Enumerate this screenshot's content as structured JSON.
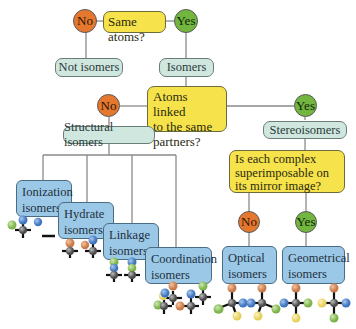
{
  "diagram": {
    "q1": {
      "text": "Same atoms?",
      "no": "No",
      "yes": "Yes"
    },
    "not_isomers": "Not isomers",
    "isomers": "Isomers",
    "q2": {
      "line1": "Atoms linked",
      "line2": "to the same",
      "line3": "partners?",
      "no": "No",
      "yes": "Yes"
    },
    "structural": "Structural isomers",
    "stereo": "Stereoisomers",
    "q3": {
      "line1": "Is each complex",
      "line2": "superimposable on",
      "line3": "its mirror image?",
      "no": "No",
      "yes": "Yes"
    },
    "structural_types": [
      {
        "line1": "Ionization",
        "line2": "isomers"
      },
      {
        "line1": "Hydrate",
        "line2": "isomers"
      },
      {
        "line1": "Linkage",
        "line2": "isomers"
      },
      {
        "line1": "Coordination",
        "line2": "isomers"
      }
    ],
    "stereo_types": [
      {
        "line1": "Optical",
        "line2": "isomers"
      },
      {
        "line1": "Geometrical",
        "line2": "isomers"
      }
    ],
    "colors": {
      "no": "#e5772f",
      "yes": "#72b53f",
      "question": "#f6e24a",
      "category": "#cfe7df",
      "type": "#9bc8e6",
      "atom_orange": "#d9895a",
      "atom_blue": "#4f86cf",
      "atom_green": "#8cc35a",
      "atom_yellow": "#f2e07a",
      "atom_gray": "#666666"
    }
  }
}
